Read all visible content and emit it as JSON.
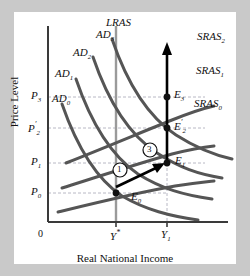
{
  "figure": {
    "axes": {
      "y_title": "Price Level",
      "x_title": "Real National Income",
      "origin_label": "0"
    },
    "y_ticks": [
      {
        "name": "p3",
        "label": "P",
        "sub": "3",
        "prime": "",
        "y": 97
      },
      {
        "name": "p2prime",
        "label": "P",
        "sub": "2",
        "prime": "′",
        "y": 128
      },
      {
        "name": "p1",
        "label": "P",
        "sub": "1",
        "prime": "",
        "y": 163
      },
      {
        "name": "p0",
        "label": "P",
        "sub": "0",
        "prime": "",
        "y": 193
      }
    ],
    "x_ticks": [
      {
        "name": "y-star",
        "label": "Y",
        "sup": "*",
        "x": 116
      },
      {
        "name": "y1",
        "label": "Y",
        "sub": "1",
        "x": 167
      }
    ],
    "curves": {
      "demand": [
        {
          "name": "AD0",
          "label": "AD",
          "sub": "0"
        },
        {
          "name": "AD1",
          "label": "AD",
          "sub": "1"
        },
        {
          "name": "AD2",
          "label": "AD",
          "sub": "2"
        },
        {
          "name": "AD3",
          "label": "AD",
          "sub": "3"
        }
      ],
      "supply": [
        {
          "name": "SRAS0",
          "label": "SRAS",
          "sub": "0"
        },
        {
          "name": "SRAS1",
          "label": "SRAS",
          "sub": "1"
        },
        {
          "name": "SRAS2",
          "label": "SRAS",
          "sub": "2"
        }
      ],
      "long_run": {
        "name": "LRAS",
        "label": "LRAS",
        "sub": ""
      }
    },
    "equilibria": [
      {
        "name": "E0",
        "label": "E",
        "sub": "0",
        "prime": "",
        "x": 116,
        "y": 193
      },
      {
        "name": "E1",
        "label": "E",
        "sub": "1",
        "prime": "",
        "x": 167,
        "y": 163
      },
      {
        "name": "E2prime",
        "label": "E",
        "sub": "2",
        "prime": "′",
        "x": 167,
        "y": 128
      },
      {
        "name": "E3",
        "label": "E",
        "sub": "3",
        "prime": "",
        "x": 167,
        "y": 97
      }
    ],
    "step_markers": [
      {
        "name": "step-1",
        "label": "1",
        "x": 120,
        "y": 170
      },
      {
        "name": "step-3",
        "label": "3",
        "x": 150,
        "y": 150
      }
    ],
    "colors": {
      "curve": "#555555",
      "lras": "#9a9a9a",
      "gridline": "#b8b8c4",
      "axis": "#3a3a3a",
      "arrow": "#000000",
      "frame": "#c9c9c9",
      "plate": "#ffffff"
    }
  }
}
